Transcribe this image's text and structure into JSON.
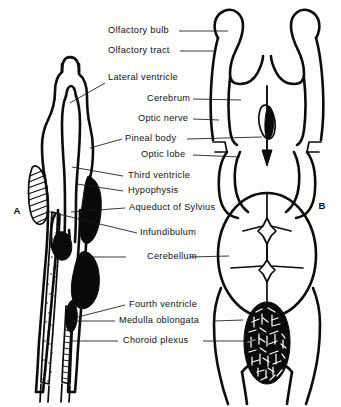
{
  "figure": {
    "panels": [
      {
        "id": "A",
        "letter": "A",
        "description": "Sagittal section of the brain"
      },
      {
        "id": "B",
        "letter": "B",
        "description": "Dorsal view of the brain"
      }
    ]
  },
  "labels": [
    {
      "id": "olfactory-bulb",
      "text": "Olfactory bulb"
    },
    {
      "id": "olfactory-tract",
      "text": "Olfactory tract"
    },
    {
      "id": "lateral-ventricle",
      "text": "Lateral ventricle"
    },
    {
      "id": "cerebrum",
      "text": "Cerebrum"
    },
    {
      "id": "optic-nerve",
      "text": "Optic nerve"
    },
    {
      "id": "pineal-body",
      "text": "Pineal body"
    },
    {
      "id": "optic-lobe",
      "text": "Optic lobe"
    },
    {
      "id": "third-ventricle",
      "text": "Third ventricle"
    },
    {
      "id": "hypophysis",
      "text": "Hypophysis"
    },
    {
      "id": "aqueduct-of-sylvius",
      "text": "Aqueduct of Sylvius"
    },
    {
      "id": "infundibulum",
      "text": "Infundibulum"
    },
    {
      "id": "cerebellum",
      "text": "Cerebellum"
    },
    {
      "id": "fourth-ventricle",
      "text": "Fourth ventricle"
    },
    {
      "id": "medulla-oblongata",
      "text": "Medulla oblongata"
    },
    {
      "id": "choroid-plexus",
      "text": "Choroid plexus"
    }
  ],
  "colors": {
    "ink": "#0c0c0c",
    "paper": "#fdfdfb",
    "leader": "#161616"
  }
}
